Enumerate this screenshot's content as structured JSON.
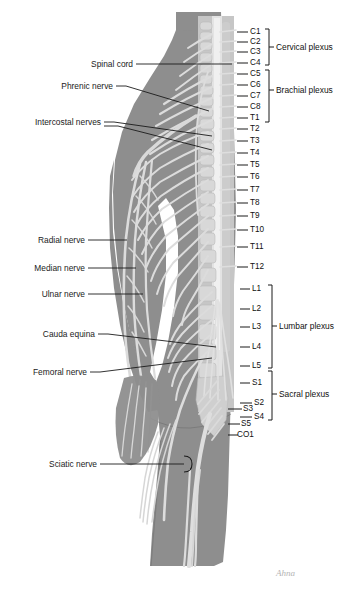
{
  "figure": {
    "background_color": "#ffffff",
    "body_fill": "#8d8d8d",
    "nerve_fill": "#d4d4d4",
    "bone_fill": "#c9c9c9",
    "line_color": "#1b1b1b",
    "text_color": "#1b1b1b"
  },
  "left_labels": [
    {
      "text": "Spinal cord",
      "x": 133,
      "y": 64,
      "lead_to_x": 232,
      "lead_to_y": 64
    },
    {
      "text": "Phrenic nerve",
      "x": 113,
      "y": 86,
      "lead_to_x": 209,
      "lead_to_y": 111
    },
    {
      "text": "Intercostal nerves",
      "x": 101,
      "y": 122,
      "lead_to_x": 212,
      "lead_to_y": 136
    },
    {
      "text": "Radial nerve",
      "x": 85,
      "y": 240,
      "lead_to_x": 127,
      "lead_to_y": 240
    },
    {
      "text": "Median nerve",
      "x": 85,
      "y": 268,
      "lead_to_x": 136,
      "lead_to_y": 268
    },
    {
      "text": "Ulnar nerve",
      "x": 85,
      "y": 294,
      "lead_to_x": 143,
      "lead_to_y": 294
    },
    {
      "text": "Cauda equina",
      "x": 95,
      "y": 334,
      "lead_to_x": 216,
      "lead_to_y": 347
    },
    {
      "text": "Femoral nerve",
      "x": 87,
      "y": 372,
      "lead_to_x": 212,
      "lead_to_y": 358
    },
    {
      "text": "Sciatic nerve",
      "x": 97,
      "y": 464,
      "lead_to_x": 184,
      "lead_to_y": 464
    }
  ],
  "segments": [
    {
      "label": "C1",
      "y": 32,
      "tick_x1": 237,
      "tick_x2": 248,
      "text_x": 250
    },
    {
      "label": "C2",
      "y": 42,
      "tick_x1": 237,
      "tick_x2": 248,
      "text_x": 250
    },
    {
      "label": "C3",
      "y": 52,
      "tick_x1": 237,
      "tick_x2": 248,
      "text_x": 250
    },
    {
      "label": "C4",
      "y": 63,
      "tick_x1": 237,
      "tick_x2": 248,
      "text_x": 250
    },
    {
      "label": "C5",
      "y": 74,
      "tick_x1": 237,
      "tick_x2": 248,
      "text_x": 250
    },
    {
      "label": "C6",
      "y": 85,
      "tick_x1": 237,
      "tick_x2": 248,
      "text_x": 250
    },
    {
      "label": "C7",
      "y": 96,
      "tick_x1": 237,
      "tick_x2": 248,
      "text_x": 250
    },
    {
      "label": "C8",
      "y": 107,
      "tick_x1": 237,
      "tick_x2": 248,
      "text_x": 250
    },
    {
      "label": "T1",
      "y": 118,
      "tick_x1": 237,
      "tick_x2": 248,
      "text_x": 250
    },
    {
      "label": "T2",
      "y": 129,
      "tick_x1": 237,
      "tick_x2": 248,
      "text_x": 250
    },
    {
      "label": "T3",
      "y": 141,
      "tick_x1": 237,
      "tick_x2": 248,
      "text_x": 250
    },
    {
      "label": "T4",
      "y": 153,
      "tick_x1": 237,
      "tick_x2": 248,
      "text_x": 250
    },
    {
      "label": "T5",
      "y": 165,
      "tick_x1": 237,
      "tick_x2": 248,
      "text_x": 250
    },
    {
      "label": "T6",
      "y": 177,
      "tick_x1": 237,
      "tick_x2": 248,
      "text_x": 250
    },
    {
      "label": "T7",
      "y": 190,
      "tick_x1": 237,
      "tick_x2": 248,
      "text_x": 250
    },
    {
      "label": "T8",
      "y": 203,
      "tick_x1": 237,
      "tick_x2": 248,
      "text_x": 250
    },
    {
      "label": "T9",
      "y": 216,
      "tick_x1": 237,
      "tick_x2": 248,
      "text_x": 250
    },
    {
      "label": "T10",
      "y": 230,
      "tick_x1": 237,
      "tick_x2": 248,
      "text_x": 250
    },
    {
      "label": "T11",
      "y": 247,
      "tick_x1": 237,
      "tick_x2": 248,
      "text_x": 250
    },
    {
      "label": "T12",
      "y": 267,
      "tick_x1": 237,
      "tick_x2": 248,
      "text_x": 250
    },
    {
      "label": "L1",
      "y": 289,
      "tick_x1": 240,
      "tick_x2": 250,
      "text_x": 252
    },
    {
      "label": "L2",
      "y": 309,
      "tick_x1": 240,
      "tick_x2": 250,
      "text_x": 252
    },
    {
      "label": "L3",
      "y": 327,
      "tick_x1": 240,
      "tick_x2": 250,
      "text_x": 252
    },
    {
      "label": "L4",
      "y": 347,
      "tick_x1": 240,
      "tick_x2": 250,
      "text_x": 252
    },
    {
      "label": "L5",
      "y": 366,
      "tick_x1": 240,
      "tick_x2": 250,
      "text_x": 252
    },
    {
      "label": "S1",
      "y": 383,
      "tick_x1": 240,
      "tick_x2": 250,
      "text_x": 252
    },
    {
      "label": "S2",
      "y": 403,
      "tick_x1": 240,
      "tick_x2": 252,
      "text_x": 254
    },
    {
      "label": "S3",
      "y": 409,
      "tick_x1": 228,
      "tick_x2": 242,
      "text_x": 243
    },
    {
      "label": "S4",
      "y": 417,
      "tick_x1": 240,
      "tick_x2": 252,
      "text_x": 254
    },
    {
      "label": "S5",
      "y": 424,
      "tick_x1": 228,
      "tick_x2": 240,
      "text_x": 241
    },
    {
      "label": "CO1",
      "y": 435,
      "tick_x1": 228,
      "tick_x2": 238,
      "text_x": 237
    }
  ],
  "plexuses": [
    {
      "name": "Cervical plexus",
      "top_y": 29,
      "bottom_y": 65,
      "bracket_x": 269,
      "text_x": 276,
      "text_y": 47
    },
    {
      "name": "Brachial plexus",
      "top_y": 70,
      "bottom_y": 122,
      "bracket_x": 269,
      "text_x": 276,
      "text_y": 90
    },
    {
      "name": "Lumbar plexus",
      "top_y": 285,
      "bottom_y": 368,
      "bracket_x": 272,
      "text_x": 279,
      "text_y": 326
    },
    {
      "name": "Sacral plexus",
      "top_y": 371,
      "bottom_y": 420,
      "bracket_x": 272,
      "text_x": 279,
      "text_y": 394
    }
  ],
  "signature": {
    "text": "Ahna",
    "x": 276,
    "y": 568
  }
}
